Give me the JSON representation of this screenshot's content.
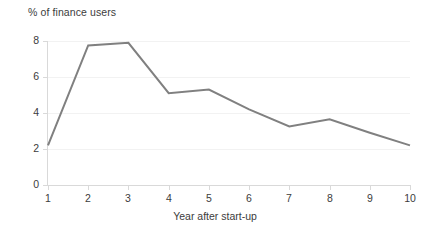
{
  "chart_data": {
    "type": "line",
    "title": "% of finance users",
    "xlabel": "Year after start-up",
    "ylabel": "",
    "categories": [
      "1",
      "2",
      "3",
      "4",
      "5",
      "6",
      "7",
      "8",
      "9",
      "10"
    ],
    "x": [
      1,
      2,
      3,
      4,
      5,
      6,
      7,
      8,
      9,
      10
    ],
    "values": [
      2.2,
      7.75,
      7.9,
      5.1,
      5.3,
      4.2,
      3.25,
      3.65,
      2.9,
      2.2
    ],
    "series": [
      {
        "name": "% of finance users",
        "values": [
          2.2,
          7.75,
          7.9,
          5.1,
          5.3,
          4.2,
          3.25,
          3.65,
          2.9,
          2.2
        ]
      }
    ],
    "ylim": [
      0,
      8
    ],
    "xlim": [
      1,
      10
    ],
    "yticks": [
      0,
      2,
      4,
      6,
      8
    ],
    "ytick_labels": [
      "0",
      "2",
      "4",
      "6",
      "8"
    ],
    "xticks": [
      1,
      2,
      3,
      4,
      5,
      6,
      7,
      8,
      9,
      10
    ],
    "xtick_labels": [
      "1",
      "2",
      "3",
      "4",
      "5",
      "6",
      "7",
      "8",
      "9",
      "10"
    ],
    "grid": "horizontal",
    "legend": "none",
    "markers": false,
    "line_color": "#808080",
    "grid_color": "#f2f2f2",
    "axis_color": "#d9d9d9",
    "text_color": "#3c3c3c",
    "background": "#ffffff"
  }
}
